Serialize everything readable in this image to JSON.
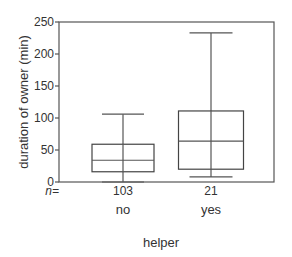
{
  "chart_data": {
    "type": "boxplot",
    "title": "",
    "xlabel": "helper",
    "ylabel": "duration of owner (min)",
    "ylim": [
      0,
      250
    ],
    "yticks": [
      0,
      50,
      100,
      150,
      200,
      250
    ],
    "n_label": "n=",
    "categories": [
      "no",
      "yes"
    ],
    "series": [
      {
        "name": "no",
        "n": "103",
        "min": 0,
        "q1": 16,
        "median": 34,
        "q3": 59,
        "max": 106
      },
      {
        "name": "yes",
        "n": "21",
        "min": 8,
        "q1": 20,
        "median": 64,
        "q3": 111,
        "max": 233
      }
    ],
    "grid": false,
    "legend": null
  },
  "layout": {
    "plot_left": 59,
    "plot_right": 274,
    "plot_top": 22,
    "plot_bottom": 182,
    "box_centers": [
      123,
      211
    ],
    "box_half_widths": [
      31,
      32.5
    ],
    "cap_half_widths": [
      21,
      21.5
    ],
    "colors": {
      "axis": "#555555",
      "box": "#444444",
      "text": "#333333"
    }
  }
}
